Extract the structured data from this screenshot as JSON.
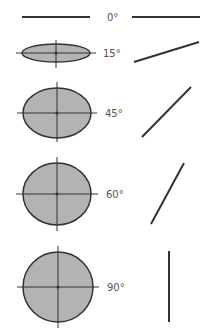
{
  "colors": {
    "stroke": "#333333",
    "fill": "#b3b3b3",
    "label": "#555555",
    "background": "#ffffff"
  },
  "rows": [
    {
      "angle_label": "0°",
      "ellipse": {
        "cx": 56,
        "cy": 17,
        "rx": 34,
        "ry": 0
      },
      "label_pos": {
        "x": 107,
        "y": 21
      },
      "line": {
        "x1": 132,
        "y1": 17,
        "x2": 200,
        "y2": 17
      }
    },
    {
      "angle_label": "15°",
      "ellipse": {
        "cx": 56,
        "cy": 53,
        "rx": 34,
        "ry": 9
      },
      "crosshair": {
        "v": [
          40,
          68
        ],
        "h": [
          16,
          96
        ]
      },
      "label_pos": {
        "x": 103,
        "y": 57
      },
      "line": {
        "x1": 134,
        "y1": 62,
        "x2": 199,
        "y2": 42
      }
    },
    {
      "angle_label": "45°",
      "ellipse": {
        "cx": 57,
        "cy": 113,
        "rx": 34,
        "ry": 25
      },
      "crosshair": {
        "v": [
          82,
          142
        ],
        "h": [
          17,
          97
        ]
      },
      "label_pos": {
        "x": 105,
        "y": 117
      },
      "line": {
        "x1": 142,
        "y1": 137,
        "x2": 191,
        "y2": 87
      }
    },
    {
      "angle_label": "60°",
      "ellipse": {
        "cx": 57,
        "cy": 194,
        "rx": 34,
        "ry": 31
      },
      "crosshair": {
        "v": [
          157,
          231
        ],
        "h": [
          16,
          98
        ]
      },
      "label_pos": {
        "x": 106,
        "y": 198
      },
      "line": {
        "x1": 151,
        "y1": 224,
        "x2": 184,
        "y2": 163
      }
    },
    {
      "angle_label": "90°",
      "ellipse": {
        "cx": 58,
        "cy": 287,
        "rx": 35,
        "ry": 35
      },
      "crosshair": {
        "v": [
          246,
          328
        ],
        "h": [
          17,
          99
        ]
      },
      "label_pos": {
        "x": 107,
        "y": 291
      },
      "line": {
        "x1": 169,
        "y1": 251,
        "x2": 169,
        "y2": 322
      }
    }
  ]
}
